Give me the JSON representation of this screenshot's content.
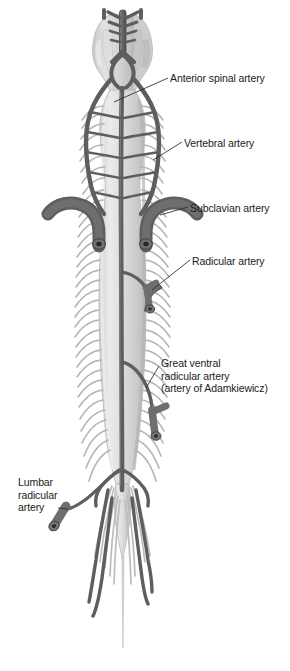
{
  "figure": {
    "background_color": "#ffffff",
    "width": 290,
    "height": 671
  },
  "palette": {
    "artery": "#6e6e6e",
    "artery_dark": "#585858",
    "artery_outline": "#3d3d3d",
    "cord_fill": "#d9d9d9",
    "cord_light": "#e8e8e8",
    "cord_shade": "#c2c2c2",
    "rootlet": "#bfbfbf",
    "brainstem": "#d2d2d2",
    "label_text": "#1b1b1b",
    "leader_line": "#2b2b2b"
  },
  "labels": [
    {
      "id": "anterior-spinal-artery",
      "lines": [
        "Anterior spinal artery"
      ],
      "x": 170,
      "y": 72,
      "side": "right"
    },
    {
      "id": "vertebral-artery",
      "lines": [
        "Vertebral artery"
      ],
      "x": 184,
      "y": 137,
      "side": "right"
    },
    {
      "id": "subclavian-artery",
      "lines": [
        "Subclavian artery"
      ],
      "x": 190,
      "y": 202,
      "side": "right"
    },
    {
      "id": "radicular-artery",
      "lines": [
        "Radicular artery"
      ],
      "x": 192,
      "y": 255,
      "side": "right"
    },
    {
      "id": "great-ventral-radicular-artery",
      "lines": [
        "Great ventral",
        "radicular artery",
        "(artery of Adamkiewicz)"
      ],
      "x": 161,
      "y": 357,
      "side": "right"
    },
    {
      "id": "lumbar-radicular-artery",
      "lines": [
        "Lumbar",
        "radicular",
        "artery"
      ],
      "x": 18,
      "y": 476,
      "side": "left"
    }
  ],
  "anatomy": {
    "structures": [
      "brainstem",
      "basilar-artery",
      "vertebral-artery-left",
      "vertebral-artery-right",
      "anterior-spinal-artery",
      "cervical-enlargement",
      "subclavian-artery-left",
      "subclavian-artery-right",
      "radicular-artery-stub",
      "thoracic-cord",
      "adamkiewicz-artery-stub",
      "lumbar-enlargement",
      "conus-medullaris",
      "cauda-equina",
      "filum-terminale",
      "lumbar-radicular-artery-stub",
      "nerve-rootlets"
    ]
  }
}
